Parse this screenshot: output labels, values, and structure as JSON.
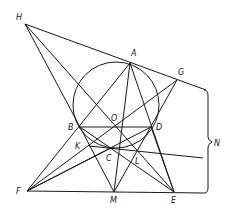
{
  "diagram": {
    "points": [
      "H",
      "A",
      "G",
      "B",
      "O",
      "D",
      "K",
      "C",
      "L",
      "F",
      "M",
      "E"
    ],
    "circle_label": "circle through A, B, D, C",
    "brace_label": "N",
    "segments": [
      [
        "H",
        "G"
      ],
      [
        "H",
        "B"
      ],
      [
        "H",
        "E"
      ],
      [
        "A",
        "F"
      ],
      [
        "A",
        "M"
      ],
      [
        "A",
        "E"
      ],
      [
        "A",
        "D"
      ],
      [
        "G",
        "F"
      ],
      [
        "G",
        "M"
      ],
      [
        "B",
        "D"
      ],
      [
        "B",
        "M"
      ],
      [
        "B",
        "E"
      ],
      [
        "D",
        "F"
      ],
      [
        "D",
        "E"
      ],
      [
        "F",
        "C"
      ],
      [
        "K",
        "N-line"
      ],
      [
        "F",
        "E"
      ]
    ]
  }
}
